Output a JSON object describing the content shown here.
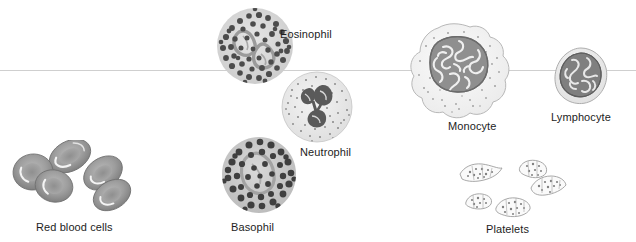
{
  "figure": {
    "background_color": "#ffffff",
    "guide_line_color": "#cfcfcf",
    "text_color": "#1d1d1d"
  },
  "labels": {
    "red_blood_cells": "Red blood cells",
    "eosinophil": "Eosinophil",
    "neutrophil": "Neutrophil",
    "basophil": "Basophil",
    "monocyte": "Monocyte",
    "lymphocyte": "Lymphocyte",
    "platelets": "Platelets"
  },
  "cells": [
    {
      "name": "red-blood-cells",
      "label": "Red blood cells",
      "count": 5,
      "description": "biconcave discs with pale central pallor",
      "fill": "#9a9a9a",
      "stroke": "#6e6e6e"
    },
    {
      "name": "eosinophil",
      "label": "Eosinophil",
      "count": 1,
      "description": "round cell densely packed with coarse dark granules, bilobed nucleus",
      "fill": "#d8d8d8",
      "granule_color": "#4a4a4a"
    },
    {
      "name": "neutrophil",
      "label": "Neutrophil",
      "count": 1,
      "description": "pale cell with fine stippling and multi-lobed dark nucleus",
      "fill": "#ececec",
      "nucleus_color": "#4f4f4f"
    },
    {
      "name": "basophil",
      "label": "Basophil",
      "count": 1,
      "description": "oval cell crowded with large dark granules obscuring nucleus",
      "fill": "#c8c8c8",
      "granule_color": "#3f3f3f"
    },
    {
      "name": "monocyte",
      "label": "Monocyte",
      "count": 1,
      "description": "largest cell, irregular outline, kidney-shaped convoluted nucleus",
      "fill": "#f2f2f2",
      "nucleus_color": "#8c8c8c"
    },
    {
      "name": "lymphocyte",
      "label": "Lymphocyte",
      "count": 1,
      "description": "small cell, large round nucleus filling most of the cell, thin rim of cytoplasm",
      "fill": "#ededed",
      "nucleus_color": "#787878"
    },
    {
      "name": "platelets",
      "label": "Platelets",
      "count": 5,
      "description": "small irregular anuclear cell fragments",
      "fill": "#fafafa",
      "stroke": "#9e9e9e"
    }
  ]
}
